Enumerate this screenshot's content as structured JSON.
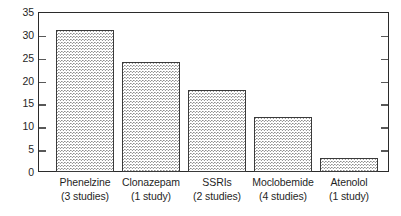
{
  "chart_data": {
    "type": "bar",
    "title": "",
    "subtitle": "",
    "xlabel": "",
    "ylabel": "",
    "ylim": [
      0,
      35
    ],
    "ytick_step": 5,
    "yticks": [
      35,
      30,
      25,
      20,
      15,
      10,
      5,
      0
    ],
    "ytick_labels": [
      "35",
      "30",
      "25",
      "20",
      "15",
      "10",
      "5",
      "0"
    ],
    "grid": false,
    "legend": null,
    "legend_position": "none",
    "categories": [
      "Phenelzine",
      "Clonazepam",
      "SSRIs",
      "Moclobemide",
      "Atenolol"
    ],
    "category_notes": [
      "(3 studies)",
      "(1 study)",
      "(2 studies)",
      "(4 studies)",
      "(1 study)"
    ],
    "values": [
      31,
      24,
      18,
      12,
      3
    ],
    "bar_fill": "#b5b5b5",
    "bar_border_color": "#3a3a3a",
    "axis_color": "#2b2b2b",
    "background": "#ffffff"
  }
}
